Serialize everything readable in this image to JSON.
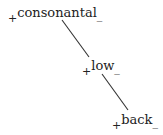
{
  "diagram": {
    "type": "feature-geometry-tree",
    "nodes": [
      {
        "id": "consonantal",
        "label": "consonantal",
        "plus": "+",
        "minus": "_"
      },
      {
        "id": "low",
        "label": "low",
        "plus": "+",
        "minus": "_"
      },
      {
        "id": "back",
        "label": "back",
        "plus": "+",
        "minus": "_"
      }
    ],
    "edges": [
      {
        "from": "consonantal",
        "to": "low"
      },
      {
        "from": "low",
        "to": "back"
      }
    ],
    "line_color": "#333333"
  }
}
